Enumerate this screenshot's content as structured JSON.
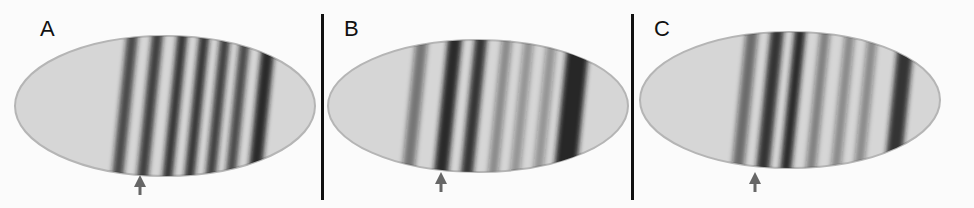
{
  "figure": {
    "background": "#fbfbfb",
    "panels": [
      {
        "label": "A",
        "label_x": 40,
        "embryo": {
          "cx": 165,
          "cy": 106,
          "rx": 150,
          "ry": 70
        },
        "stripes": [
          {
            "x": 125,
            "w": 11,
            "dark": 0.75
          },
          {
            "x": 150,
            "w": 11,
            "dark": 0.8
          },
          {
            "x": 175,
            "w": 10,
            "dark": 0.85
          },
          {
            "x": 197,
            "w": 10,
            "dark": 0.85
          },
          {
            "x": 218,
            "w": 10,
            "dark": 0.8
          },
          {
            "x": 238,
            "w": 10,
            "dark": 0.75
          },
          {
            "x": 262,
            "w": 13,
            "dark": 0.9
          }
        ],
        "arrow": {
          "x": 140,
          "y": 175
        }
      },
      {
        "label": "B",
        "label_x": 344,
        "embryo": {
          "cx": 478,
          "cy": 106,
          "rx": 150,
          "ry": 66
        },
        "stripes": [
          {
            "x": 415,
            "w": 12,
            "dark": 0.5
          },
          {
            "x": 448,
            "w": 14,
            "dark": 0.9
          },
          {
            "x": 474,
            "w": 12,
            "dark": 0.85
          },
          {
            "x": 500,
            "w": 10,
            "dark": 0.4
          },
          {
            "x": 522,
            "w": 10,
            "dark": 0.35
          },
          {
            "x": 545,
            "w": 10,
            "dark": 0.35
          },
          {
            "x": 572,
            "w": 22,
            "dark": 0.95
          }
        ],
        "arrow": {
          "x": 441,
          "y": 172
        }
      },
      {
        "label": "C",
        "label_x": 654,
        "embryo": {
          "cx": 790,
          "cy": 100,
          "rx": 150,
          "ry": 68
        },
        "stripes": [
          {
            "x": 745,
            "w": 12,
            "dark": 0.55
          },
          {
            "x": 770,
            "w": 13,
            "dark": 0.85
          },
          {
            "x": 793,
            "w": 11,
            "dark": 0.9
          },
          {
            "x": 818,
            "w": 10,
            "dark": 0.45
          },
          {
            "x": 843,
            "w": 10,
            "dark": 0.4
          },
          {
            "x": 866,
            "w": 10,
            "dark": 0.4
          },
          {
            "x": 900,
            "w": 16,
            "dark": 0.85
          }
        ],
        "arrow": {
          "x": 755,
          "y": 172
        }
      }
    ],
    "dividers": [
      322,
      632
    ],
    "arrow_color": "#666666",
    "embryo_fill": "#d6d6d6",
    "embryo_edge": "#b5b5b5",
    "stripe_color": "#1a1a1a"
  }
}
